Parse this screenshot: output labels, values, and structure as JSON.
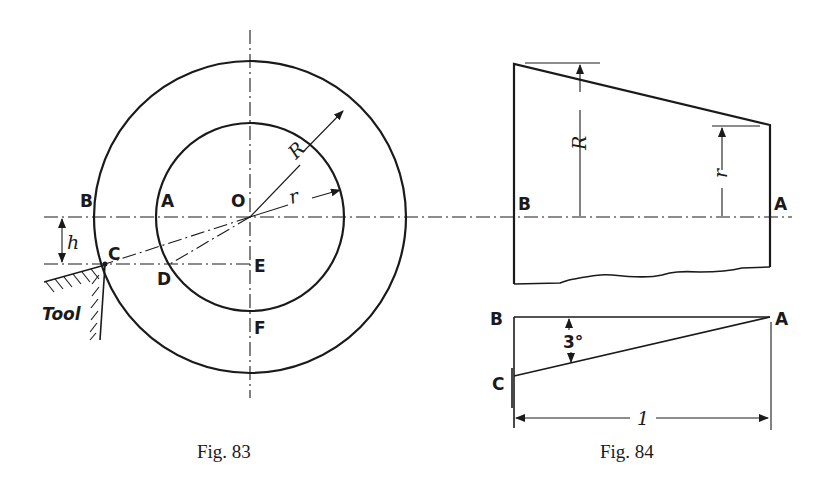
{
  "figures": [
    {
      "caption": "Fig. 83",
      "labels": {
        "B": "B",
        "A": "A",
        "O": "O",
        "C": "C",
        "D": "D",
        "E": "E",
        "F": "F",
        "R": "R",
        "r": "r",
        "h": "h",
        "tool": "Tool"
      }
    },
    {
      "caption": "Fig. 84",
      "labels": {
        "B_top": "B",
        "A_top": "A",
        "R": "R",
        "r": "r",
        "B_bottom": "B",
        "A_bottom": "A",
        "C": "C",
        "angle": "3°",
        "length": "1"
      }
    }
  ],
  "colors": {
    "ink": "#1a1a1a",
    "paper": "#ffffff"
  }
}
